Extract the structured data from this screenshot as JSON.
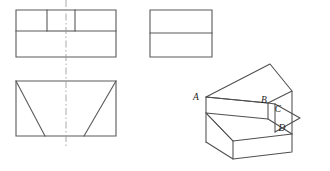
{
  "figure": {
    "background_color": "#ffffff",
    "line_color": "#5a5a5a",
    "iso_line_color": "#4f4f4f",
    "centerline_color": "#9a9a9a"
  },
  "views": {
    "top_view": {
      "name": "top-view",
      "outer_rect": {
        "x": 16,
        "y": 10,
        "width": 100,
        "height": 47
      },
      "inner_left_rect": {
        "x": 16,
        "y": 10,
        "width": 31,
        "height": 21
      },
      "inner_right_rect": {
        "x": 75,
        "y": 10,
        "width": 41,
        "height": 21
      },
      "divider_y": 31
    },
    "side_view": {
      "name": "side-view",
      "outer_rect": {
        "x": 150,
        "y": 10,
        "width": 62,
        "height": 47
      },
      "divider_y": 33
    },
    "front_view": {
      "name": "front-view",
      "outer_rect": {
        "x": 16,
        "y": 81,
        "width": 100,
        "height": 55
      },
      "left_diagonal": {
        "x1": 16,
        "y1": 81,
        "x2": 45,
        "y2": 136
      },
      "right_diagonal": {
        "x1": 116,
        "y1": 81,
        "x2": 84,
        "y2": 136
      }
    },
    "center_line": {
      "x": 66,
      "y1": 0,
      "y2": 146
    }
  },
  "pictorial": {
    "name": "isometric-pictorial",
    "labels": [
      {
        "id": "A",
        "text": "A",
        "x": 196,
        "y": 100
      },
      {
        "id": "B",
        "text": "B",
        "x": 264,
        "y": 103
      },
      {
        "id": "C",
        "text": "C",
        "x": 278,
        "y": 112
      },
      {
        "id": "D",
        "text": "D",
        "x": 282,
        "y": 131
      }
    ],
    "geometry": {
      "slanted_top_face": "M 206,97 L 270,64 L 292,91 L 268,103 Z",
      "front_upper_face": "M 206,97 L 268,103 L 268,119 L 206,113 Z",
      "left_end_face": "M 206,97 L 206,113 L 206,142 L 206,124",
      "step_top_face": "M 206,124 L 268,119 L 292,134 L 233,141 Z",
      "base_front_face": "M 206,124 L 206,142 L 233,159 L 233,141 Z",
      "base_right_face": "M 233,159 L 292,152 L 292,134 L 233,141 Z",
      "notch_vertical": "M 275,105 L 275,131",
      "notch_diagonal": "M 275,105 L 298,118 L 275,131",
      "right_column": "M 292,91 L 292,134",
      "base_bottom_edge": "M 206,142 L 233,159 L 292,152"
    }
  }
}
